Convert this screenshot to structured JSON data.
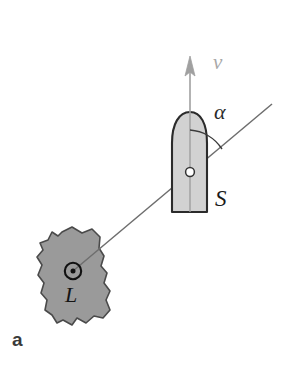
{
  "figure": {
    "panel_label": "a",
    "caption_letter": "a",
    "background_color": "#ffffff"
  },
  "labels": {
    "velocity": "v",
    "angle": "α",
    "ship": "S",
    "landmark": "L"
  },
  "colors": {
    "ship_fill": "#d2d2d2",
    "ship_outline": "#2b2b2b",
    "land_fill": "#9a9a9a",
    "land_outline": "#4a4a4a",
    "bearing_line": "#6e6e6e",
    "heading_line": "#9b9b9b",
    "arrow": "#a0a0a0",
    "arc": "#3a3a3a",
    "marker_ring": "#111111",
    "pivot_fill": "#ffffff"
  },
  "geometry": {
    "ship_center": {
      "x": 190,
      "y": 172
    },
    "ship_bow": {
      "x": 190,
      "y": 112
    },
    "ship_stern_y": 212,
    "ship_left_x": 172,
    "ship_right_x": 207,
    "velocity_arrow_tip": {
      "x": 190,
      "y": 57
    },
    "velocity_arrow_tail": {
      "x": 190,
      "y": 113
    },
    "landmark_marker": {
      "x": 73,
      "y": 271
    },
    "bearing_line_start": {
      "x": 73,
      "y": 271
    },
    "bearing_line_end": {
      "x": 272,
      "y": 104
    },
    "angle_arc_radius": 42
  },
  "elements": {
    "ship_name": "ship",
    "land_name": "landmass",
    "bearing_name": "line-of-sight",
    "heading_name": "heading-axis",
    "arrow_name": "velocity-arrow",
    "arc_name": "angle-arc"
  }
}
